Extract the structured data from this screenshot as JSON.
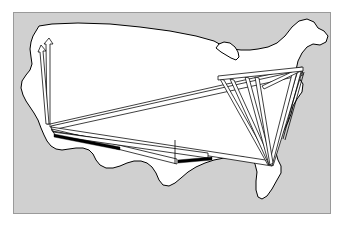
{
  "panel": {
    "background_color": "#d0d0d0",
    "border_color": "#9a9a9a",
    "outer_background_color": "#ffffff",
    "x": 13,
    "y": 12,
    "width": 318,
    "height": 202
  },
  "map": {
    "region_name": "Contiguous United States",
    "land_fill_color": "#ffffff",
    "land_stroke_color": "#000000",
    "outline_path": "M 33 36 L 39 26 L 52 24 L 78 23 L 110 24 L 140 27 L 170 31 L 196 36 L 214 41 L 223 46 L 232 49 L 241 50 L 250 50 L 258 49 L 268 47 L 277 43 L 285 36 L 292 27 L 299 21 L 307 19 L 314 22 L 318 28 L 324 31 L 328 36 L 326 42 L 320 45 L 313 44 L 307 47 L 302 53 L 298 61 L 296 70 L 299 78 L 303 84 L 302 92 L 297 99 L 293 106 L 291 114 L 288 122 L 284 130 L 280 138 L 277 146 L 276 153 L 278 160 L 281 166 L 281 173 L 277 180 L 272 189 L 267 196 L 262 199 L 258 197 L 256 190 L 256 181 L 257 172 L 255 164 L 250 159 L 243 157 L 234 157 L 224 158 L 214 160 L 205 163 L 196 167 L 188 172 L 181 178 L 175 183 L 169 186 L 163 185 L 159 180 L 156 173 L 152 167 L 147 163 L 141 161 L 134 161 L 127 163 L 120 166 L 113 168 L 106 168 L 100 165 L 96 160 L 93 154 L 89 150 L 83 148 L 76 148 L 69 149 L 62 150 L 56 149 L 51 146 L 47 141 L 44 135 L 41 128 L 38 120 L 34 113 L 30 107 L 26 101 L 23 95 L 21 88 L 22 81 L 26 75 L 30 70 L 32 64 L 31 57 L 30 49 L 31 42 Z",
    "great_lakes_path": "M 216 48 L 219 44 L 224 42 L 230 43 L 235 47 L 238 52 L 239 57 L 236 60 L 231 58 L 226 55 L 221 52 Z",
    "florida_path": "M 253 160 L 258 164 L 261 171 L 262 180 L 261 189 L 258 196 L 254 199 L 251 196 L 250 189 L 251 180 L 252 170 Z"
  },
  "hubs": [
    {
      "id": "hub-los-angeles",
      "label": "Los Angeles",
      "x": 50,
      "y": 124
    },
    {
      "id": "hub-seattle",
      "label": "Seattle",
      "x": 49,
      "y": 40
    },
    {
      "id": "hub-san-francisco",
      "label": "San Francisco",
      "x": 41,
      "y": 47
    },
    {
      "id": "hub-new-york",
      "label": "New York",
      "x": 303,
      "y": 69
    },
    {
      "id": "hub-miami",
      "label": "Miami",
      "x": 272,
      "y": 163
    },
    {
      "id": "hub-dallas",
      "label": "Dallas",
      "x": 174,
      "y": 145
    },
    {
      "id": "hub-houston",
      "label": "Houston",
      "x": 176,
      "y": 161
    },
    {
      "id": "hub-chicago",
      "label": "Chicago",
      "x": 218,
      "y": 78
    }
  ],
  "routes": [
    {
      "id": "route-la-seattle-a",
      "from": "Los Angeles",
      "to": "Seattle",
      "style": "tapered-arrow",
      "path": "M 50 124 L 47 124 L 46 44 L 44 44 L 49 38 L 53 44 L 50 44 Z"
    },
    {
      "id": "route-la-sanfrancisco-b",
      "from": "Los Angeles",
      "to": "San Francisco",
      "style": "tapered-arrow",
      "path": "M 49 124 L 46 124 L 40 52 L 38 52 L 41 45 L 46 51 L 43 51 Z"
    },
    {
      "id": "route-la-newyork",
      "from": "Los Angeles",
      "to": "New York",
      "style": "tapered-band",
      "path": "M 50 124 L 50 127 L 302 72 L 302 67 Z"
    },
    {
      "id": "route-la-newyork-2",
      "from": "Los Angeles",
      "to": "New York",
      "style": "tapered-band",
      "path": "M 51 126 L 52 130 L 303 75 L 302 70 Z"
    },
    {
      "id": "route-la-miami",
      "from": "Los Angeles",
      "to": "Miami",
      "style": "tapered-band",
      "path": "M 51 127 L 52 131 L 272 166 L 272 161 Z"
    },
    {
      "id": "route-la-houston",
      "from": "Los Angeles",
      "to": "Houston",
      "style": "tapered-band",
      "path": "M 52 129 L 54 133 L 177 164 L 177 159 Z"
    },
    {
      "id": "route-la-dallas",
      "from": "Los Angeles",
      "to": "Dallas",
      "style": "thin",
      "path": "M 52 131 L 176 152"
    },
    {
      "id": "route-la-east-band",
      "from": "Los Angeles",
      "to": "Southeast",
      "style": "tapered-band",
      "path": "M 53 132 L 56 136 L 208 158 L 208 153 Z"
    },
    {
      "id": "route-newyork-miami-1",
      "from": "New York",
      "to": "Miami",
      "style": "tapered-arrow",
      "path": "M 302 72 L 298 70 L 270 164 L 273 166 Z"
    },
    {
      "id": "route-newyork-miami-2",
      "from": "New York",
      "to": "Miami",
      "style": "tapered-arrow",
      "path": "M 297 72 L 293 70 L 269 164 L 272 166 Z"
    },
    {
      "id": "route-chicago-miami-1",
      "from": "Chicago",
      "to": "Miami",
      "style": "tapered-arrow",
      "path": "M 224 80 L 220 79 L 268 165 L 271 163 Z"
    },
    {
      "id": "route-chicago-miami-2",
      "from": "Chicago",
      "to": "Miami",
      "style": "tapered-arrow",
      "path": "M 234 80 L 230 79 L 269 165 L 272 163 Z"
    },
    {
      "id": "route-midatlantic-miami",
      "from": "Mid-Atlantic",
      "to": "Miami",
      "style": "tapered-arrow",
      "path": "M 249 78 L 245 77 L 269 165 L 272 163 Z"
    },
    {
      "id": "route-midatlantic-miami-2",
      "from": "Mid-Atlantic",
      "to": "Miami",
      "style": "tapered-arrow",
      "path": "M 259 78 L 255 77 L 270 165 L 273 163 Z"
    },
    {
      "id": "route-northeast-local",
      "from": "New York",
      "to": "Mid-Atlantic",
      "style": "tapered-arrow",
      "path": "M 303 70 L 300 68 L 262 86 L 264 89 Z"
    },
    {
      "id": "route-chicago-northeast",
      "from": "Chicago",
      "to": "New York",
      "style": "tapered-band",
      "path": "M 218 76 L 218 80 L 303 71 L 303 67 Z"
    },
    {
      "id": "route-houston-short",
      "from": "Dallas",
      "to": "Houston",
      "style": "thin",
      "path": "M 175 140 L 175 164"
    },
    {
      "id": "route-gulf-horizontal",
      "from": "Houston",
      "to": "Gulf Coast",
      "style": "solid",
      "path": "M 178 160 L 212 157 L 212 160 L 178 163 Z"
    },
    {
      "id": "route-southwest-horizontal",
      "from": "Los Angeles",
      "to": "Southwest",
      "style": "solid",
      "path": "M 54 134 L 120 147 L 120 150 L 54 137 Z"
    },
    {
      "id": "route-ny-coastal",
      "from": "New York",
      "to": "Southeast Coast",
      "style": "thin",
      "path": "M 304 72 L 285 140"
    },
    {
      "id": "route-ny-coastal-2",
      "from": "New York",
      "to": "Southeast Coast",
      "style": "thin",
      "path": "M 301 72 L 283 139"
    }
  ]
}
